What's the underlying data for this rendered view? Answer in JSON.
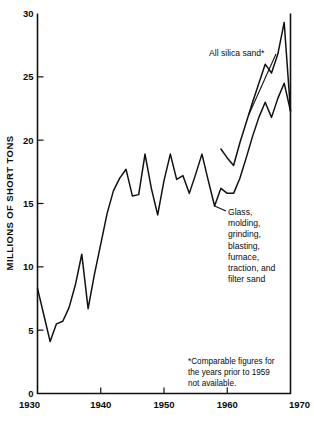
{
  "chart_data": {
    "type": "line",
    "title": "",
    "subtitle": "",
    "xlabel": "",
    "ylabel": "MILLIONS OF SHORT TONS",
    "xlim": [
      1930,
      1970
    ],
    "ylim": [
      0,
      30
    ],
    "xticks": [
      1930,
      1940,
      1950,
      1960,
      1970
    ],
    "xtick_labels": [
      "1930",
      "1940",
      "1950",
      "1960",
      "1970"
    ],
    "yticks": [
      0,
      5,
      10,
      15,
      20,
      25,
      30
    ],
    "ytick_labels": [
      "0",
      "5",
      "10",
      "15",
      "20",
      "25",
      "30"
    ],
    "grid": false,
    "legend_position": "inline-annotations",
    "series": [
      {
        "name": "Glass, molding, grinding, blasting, furnace, traction, and filter sand",
        "x": [
          1930,
          1931,
          1932,
          1933,
          1934,
          1935,
          1936,
          1937,
          1938,
          1939,
          1940,
          1941,
          1942,
          1943,
          1944,
          1945,
          1946,
          1947,
          1948,
          1949,
          1950,
          1951,
          1952,
          1953,
          1954,
          1955,
          1956,
          1957,
          1958,
          1959,
          1960,
          1961,
          1962,
          1963,
          1964,
          1965,
          1966,
          1967,
          1968,
          1969,
          1970
        ],
        "values": [
          8.3,
          6.2,
          4.1,
          5.5,
          5.7,
          6.8,
          8.6,
          11.0,
          6.7,
          9.4,
          11.8,
          14.2,
          16.0,
          17.0,
          17.7,
          15.6,
          15.7,
          18.9,
          16.2,
          14.1,
          16.8,
          18.9,
          16.9,
          17.2,
          15.8,
          17.3,
          18.9,
          16.8,
          14.8,
          16.2,
          15.8,
          15.8,
          17.0,
          18.6,
          20.3,
          21.8,
          23.0,
          21.8,
          23.3,
          24.5,
          22.3
        ]
      },
      {
        "name": "All silica sand*",
        "x": [
          1959,
          1960,
          1961,
          1962,
          1963,
          1964,
          1965,
          1966,
          1967,
          1968,
          1969,
          1970
        ],
        "values": [
          19.3,
          18.6,
          18.0,
          19.8,
          21.4,
          23.0,
          24.5,
          26.0,
          25.3,
          26.8,
          29.3,
          22.3
        ]
      }
    ],
    "annotations": [
      {
        "name": "all-silica-sand-label",
        "text": "All silica sand*",
        "target_x": 1963.4,
        "target_y": 22.0
      },
      {
        "name": "glass-molding-label",
        "lines": [
          "Glass,",
          "molding,",
          "grinding,",
          "blasting,",
          "furnace,",
          "traction, and",
          "filter sand"
        ],
        "target_x": 1958.0,
        "target_y": 14.8
      }
    ],
    "footnote": {
      "lines": [
        "*Comparable figures for",
        "the years prior to 1959",
        "not available."
      ]
    },
    "colors": {
      "line": "#111111",
      "axis": "#111111",
      "background": "#ffffff",
      "text": "#0a0a0a"
    }
  }
}
